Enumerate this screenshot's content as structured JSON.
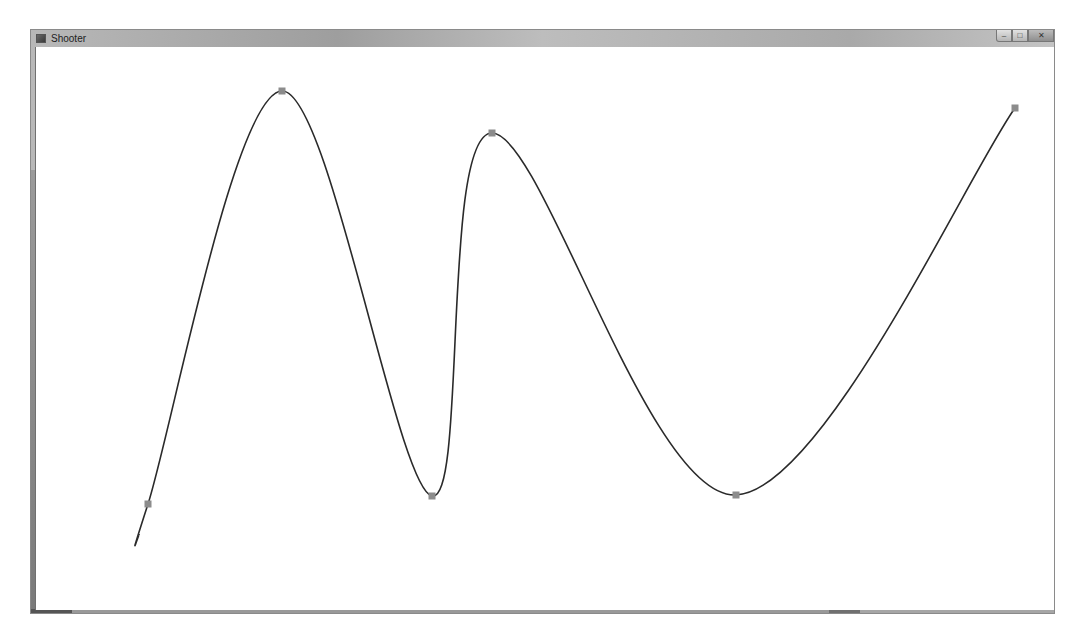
{
  "window": {
    "title": "Shooter",
    "icon": "app-icon",
    "controls": [
      {
        "name": "minimize",
        "glyph": "–"
      },
      {
        "name": "maximize",
        "glyph": "□"
      },
      {
        "name": "close",
        "glyph": "✕"
      }
    ]
  },
  "canvas": {
    "background": "#ffffff",
    "curve_color": "#2a2a2a",
    "control_point_color": "#8c8c8c",
    "curve_start": [
      139,
      535
    ],
    "control_points": [
      [
        148,
        504
      ],
      [
        282,
        91
      ],
      [
        432,
        496
      ],
      [
        492,
        133
      ],
      [
        736,
        495
      ],
      [
        1015,
        108
      ]
    ]
  }
}
